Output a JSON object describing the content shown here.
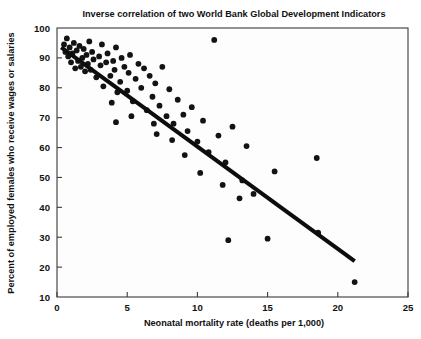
{
  "chart_data": {
    "type": "scatter",
    "title": "Inverse correlation of two World Bank Global Development Indicators",
    "xlabel": "Neonatal mortality rate (deaths per 1,000)",
    "ylabel": "Percent of employed females who receive wages or salaries",
    "xlim": [
      0,
      25
    ],
    "ylim": [
      10,
      100
    ],
    "xticks": [
      0,
      5,
      10,
      15,
      20,
      25
    ],
    "yticks": [
      10,
      20,
      30,
      40,
      50,
      60,
      70,
      80,
      90,
      100
    ],
    "xtick_labels": [
      "0",
      "5",
      "10",
      "15",
      "20",
      "25"
    ],
    "ytick_labels": [
      "10",
      "20",
      "30",
      "40",
      "50",
      "60",
      "70",
      "80",
      "90",
      "100"
    ],
    "grid": false,
    "legend": false,
    "marker_color": "#131313",
    "trendline_color": "#0d0d0d",
    "frame_color": "#3a3a3a",
    "background_color": "#fdfdfd",
    "series": [
      {
        "name": "Countries",
        "points": [
          [
            0.5,
            94.5
          ],
          [
            0.6,
            92.0
          ],
          [
            0.7,
            96.5
          ],
          [
            0.8,
            90.5
          ],
          [
            0.9,
            93.5
          ],
          [
            1.0,
            88.5
          ],
          [
            1.1,
            91.5
          ],
          [
            1.2,
            95.0
          ],
          [
            1.3,
            86.5
          ],
          [
            1.4,
            92.5
          ],
          [
            1.5,
            89.0
          ],
          [
            1.6,
            94.0
          ],
          [
            1.7,
            87.0
          ],
          [
            1.8,
            90.0
          ],
          [
            1.9,
            93.0
          ],
          [
            2.0,
            85.5
          ],
          [
            2.1,
            91.0
          ],
          [
            2.2,
            88.0
          ],
          [
            2.3,
            95.5
          ],
          [
            2.4,
            86.0
          ],
          [
            2.5,
            92.0
          ],
          [
            2.6,
            89.5
          ],
          [
            2.8,
            83.5
          ],
          [
            3.0,
            90.5
          ],
          [
            3.1,
            87.5
          ],
          [
            3.2,
            94.5
          ],
          [
            3.3,
            80.5
          ],
          [
            3.5,
            88.5
          ],
          [
            3.6,
            91.5
          ],
          [
            3.8,
            84.0
          ],
          [
            4.0,
            89.0
          ],
          [
            4.1,
            86.0
          ],
          [
            4.2,
            93.5
          ],
          [
            4.3,
            78.5
          ],
          [
            4.5,
            82.0
          ],
          [
            4.6,
            90.0
          ],
          [
            4.8,
            87.0
          ],
          [
            5.0,
            79.0
          ],
          [
            5.1,
            85.0
          ],
          [
            5.2,
            91.0
          ],
          [
            5.4,
            75.5
          ],
          [
            5.6,
            83.0
          ],
          [
            5.8,
            88.0
          ],
          [
            6.0,
            80.0
          ],
          [
            6.2,
            86.5
          ],
          [
            6.4,
            72.5
          ],
          [
            6.6,
            84.0
          ],
          [
            6.8,
            77.0
          ],
          [
            7.0,
            81.5
          ],
          [
            7.3,
            74.0
          ],
          [
            7.5,
            87.0
          ],
          [
            7.8,
            70.5
          ],
          [
            8.0,
            79.5
          ],
          [
            8.3,
            68.0
          ],
          [
            8.6,
            76.0
          ],
          [
            9.0,
            71.0
          ],
          [
            9.3,
            65.5
          ],
          [
            9.6,
            73.5
          ],
          [
            10.0,
            62.0
          ],
          [
            10.4,
            69.0
          ],
          [
            10.8,
            58.5
          ],
          [
            11.2,
            96.0
          ],
          [
            11.5,
            64.0
          ],
          [
            12.0,
            55.0
          ],
          [
            12.5,
            67.0
          ],
          [
            13.0,
            43.0
          ],
          [
            13.5,
            60.5
          ],
          [
            14.0,
            44.5
          ],
          [
            15.0,
            29.5
          ],
          [
            15.5,
            52.0
          ],
          [
            12.2,
            29.0
          ],
          [
            18.5,
            56.5
          ],
          [
            18.6,
            31.5
          ],
          [
            21.2,
            15.0
          ],
          [
            4.2,
            68.5
          ],
          [
            6.9,
            68.0
          ],
          [
            8.2,
            62.5
          ],
          [
            9.1,
            57.5
          ],
          [
            10.2,
            51.5
          ],
          [
            11.8,
            47.5
          ],
          [
            13.2,
            49.0
          ],
          [
            7.1,
            64.5
          ],
          [
            5.3,
            70.5
          ],
          [
            3.9,
            75.0
          ]
        ]
      }
    ],
    "trendline": {
      "x0": 0.3,
      "y0": 93.5,
      "x1": 21.2,
      "y1": 22.0
    }
  }
}
